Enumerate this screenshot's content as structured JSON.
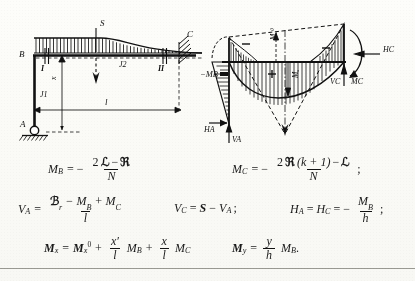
{
  "figure": {
    "left_diagram": {
      "name": "L-frame with distributed load",
      "labels": {
        "joint_b": "B",
        "joint_c": "C",
        "support_a": "A",
        "column_inertia": "J1",
        "beam_inertia": "J2",
        "section_left": "I",
        "section_right": "II",
        "point_load": "S",
        "span": "l",
        "abscissa": "x"
      }
    },
    "right_diagram": {
      "name": "bending moment diagram",
      "labels": {
        "moment_b": "−MB",
        "moment_c": "MC",
        "reaction_ha": "HA",
        "reaction_va": "VA",
        "reaction_hc": "HC",
        "reaction_vc": "VC",
        "moment_c_couple": "MC",
        "area_neg_left": "−",
        "area_pos_mid": "+",
        "area_neg_right": "−",
        "ordinate_m0": "Mₓ⁰",
        "ordinate_mx": "Mₓ"
      }
    }
  },
  "formulas": {
    "row1": {
      "mb": {
        "lhs_sym": "M",
        "lhs_sub": "B",
        "eq": "= −",
        "num_pre": "2",
        "num_frak1": "ℒ",
        "num_op": "−",
        "num_frak2": "ℜ",
        "den": "N"
      },
      "mc": {
        "lhs_sym": "M",
        "lhs_sub": "C",
        "eq": "= −",
        "num_pre": "2",
        "num_frak1": "ℜ",
        "num_paren": "(k + 1)",
        "num_op": "−",
        "num_frak2": "ℒ",
        "den": "N",
        "tail": ";"
      }
    },
    "row2": {
      "va": {
        "lhs_sym": "V",
        "lhs_sub": "A",
        "eq": "=",
        "num_frak": "ℬ",
        "num_frak_sub": "r",
        "num_rest1": "− M",
        "num_sub1": "B",
        "num_rest2": "+ M",
        "num_sub2": "C",
        "den": "l"
      },
      "vc": {
        "lhs_sym": "V",
        "lhs_sub": "C",
        "eq": "=",
        "rhs_bold": "S",
        "rhs_op": "−",
        "rhs_sym": "V",
        "rhs_sub": "A",
        "tail": ";"
      },
      "ha": {
        "lhs_sym": "H",
        "lhs_sub": "A",
        "eq1": "=",
        "mid_sym": "H",
        "mid_sub": "C",
        "eq2": "= −",
        "num_sym": "M",
        "num_sub": "B",
        "den": "h",
        "tail": ";"
      }
    },
    "row3": {
      "mx": {
        "lhs_sym": "M",
        "lhs_sub": "x",
        "eq": "=",
        "t1_sym": "M",
        "t1_sub": "x",
        "t1_sup": "0",
        "op1": "+",
        "f1_num": "x′",
        "f1_den": "l",
        "t2_sym": "M",
        "t2_sub": "B",
        "op2": "+",
        "f2_num": "x",
        "f2_den": "l",
        "t3_sym": "M",
        "t3_sub": "C"
      },
      "my": {
        "lhs_sym": "M",
        "lhs_sub": "y",
        "eq": "=",
        "f_num": "y",
        "f_den": "h",
        "t_sym": "M",
        "t_sub": "B",
        "tail": "."
      }
    }
  },
  "colors": {
    "ink": "#111111",
    "paper": "#fdfdfb",
    "rule": "#9a9a93"
  }
}
